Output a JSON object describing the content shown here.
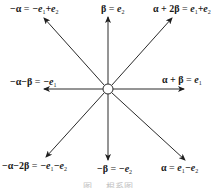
{
  "diagram": {
    "type": "root-system",
    "center": {
      "x": 108,
      "y": 89,
      "radius": 5
    },
    "stroke_color": "#2a2a2a",
    "vectors": [
      {
        "id": "neg-alpha",
        "label_lhs": "−α",
        "label_rhs_parts": [
          "−e",
          "1",
          "+e",
          "2"
        ],
        "tip": {
          "x": 44,
          "y": 18
        }
      },
      {
        "id": "beta",
        "label_lhs": "β",
        "label_rhs_parts": [
          "e",
          "2"
        ],
        "tip": {
          "x": 108,
          "y": 17
        }
      },
      {
        "id": "alpha-plus-2beta",
        "label_lhs": "α + 2β",
        "label_rhs_parts": [
          "e",
          "1",
          "+e",
          "2"
        ],
        "tip": {
          "x": 172,
          "y": 18
        }
      },
      {
        "id": "neg-alpha-minus-beta",
        "label_lhs": "−α−β",
        "label_rhs_parts": [
          "−e",
          "1"
        ],
        "tip": {
          "x": 44,
          "y": 89
        }
      },
      {
        "id": "alpha-plus-beta",
        "label_lhs": "α + β",
        "label_rhs_parts": [
          "e",
          "1"
        ],
        "tip": {
          "x": 184,
          "y": 89
        }
      },
      {
        "id": "neg-alpha-minus-2beta",
        "label_lhs": "−α−2β",
        "label_rhs_parts": [
          "−e",
          "1",
          "−e",
          "2"
        ],
        "tip": {
          "x": 46,
          "y": 157
        }
      },
      {
        "id": "neg-beta",
        "label_lhs": "−β",
        "label_rhs_parts": [
          "−e",
          "2"
        ],
        "tip": {
          "x": 108,
          "y": 160
        }
      },
      {
        "id": "alpha",
        "label_lhs": "α",
        "label_rhs_parts": [
          "e",
          "1",
          "−e",
          "2"
        ],
        "tip": {
          "x": 185,
          "y": 160
        }
      }
    ]
  },
  "labels": {
    "neg_alpha": {
      "lhs": "−α",
      "eq": " = ",
      "t1": "−e",
      "s1": "1",
      "t2": "+e",
      "s2": "2"
    },
    "beta": {
      "lhs": "β",
      "eq": " = ",
      "t1": "e",
      "s1": "2"
    },
    "alpha_plus_2beta": {
      "lhs": "α + 2β",
      "eq": " = ",
      "t1": "e",
      "s1": "1",
      "t2": "+e",
      "s2": "2"
    },
    "neg_alpha_minus_beta": {
      "lhs": "−α−β",
      "eq": " = ",
      "t1": "−e",
      "s1": "1"
    },
    "alpha_plus_beta": {
      "lhs": "α + β",
      "eq": " = ",
      "t1": "e",
      "s1": "1"
    },
    "neg_alpha_minus_2beta": {
      "lhs": "−α−2β",
      "eq": " = ",
      "t1": "−e",
      "s1": "1",
      "t2": "−e",
      "s2": "2"
    },
    "neg_beta": {
      "lhs": "−β",
      "eq": " = ",
      "t1": "−e",
      "s1": "2"
    },
    "alpha": {
      "lhs": "α",
      "eq": " = ",
      "t1": "e",
      "s1": "1",
      "t2": "−e",
      "s2": "2"
    }
  },
  "caption": "图 ... 根系图"
}
